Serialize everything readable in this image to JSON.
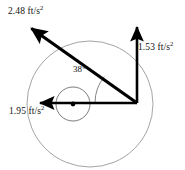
{
  "diagram": {
    "origin": {
      "x": 137,
      "y": 103
    },
    "vectors": [
      {
        "name": "resultant-acceleration",
        "label_value": "2.48",
        "label_units": "ft/s",
        "label_exponent": "2",
        "label_full": "2.48 ft/s²",
        "tip": {
          "x": 26,
          "y": 25
        },
        "direction": "up-left-diagonal",
        "color": "#000000",
        "stroke_width": 3.2
      },
      {
        "name": "vertical-acceleration",
        "label_value": "1.53",
        "label_units": "ft/s",
        "label_exponent": "2",
        "label_full": "1.53 ft/s²",
        "tip": {
          "x": 137,
          "y": 22
        },
        "direction": "up",
        "color": "#000000",
        "stroke_width": 2.6
      },
      {
        "name": "horizontal-acceleration",
        "label_value": "1.95",
        "label_units": "ft/s",
        "label_exponent": "2",
        "label_full": "1.95 ft/s²",
        "tip": {
          "x": 35,
          "y": 103
        },
        "direction": "left",
        "color": "#000000",
        "stroke_width": 2.6
      }
    ],
    "angle": {
      "name": "angle-between-horizontal-and-resultant",
      "value": "38",
      "symbol": "°",
      "label_full": "38°",
      "arc_radius": 42,
      "color": "#555555"
    },
    "circles": [
      {
        "name": "outer-path-circle",
        "cx": 90,
        "cy": 104,
        "r": 63,
        "stroke": "#999999",
        "stroke_width": 0.9
      },
      {
        "name": "inner-path-circle",
        "cx": 73,
        "cy": 104,
        "r": 17,
        "stroke": "#666666",
        "stroke_width": 0.9
      }
    ],
    "center_dot": {
      "name": "circle-center-dot",
      "cx": 73,
      "cy": 104,
      "r": 2.4,
      "fill": "#000000"
    },
    "colors": {
      "vector": "#000000",
      "circle_outer": "#999999",
      "circle_inner": "#666666",
      "text": "#111111",
      "background": "#ffffff"
    }
  }
}
